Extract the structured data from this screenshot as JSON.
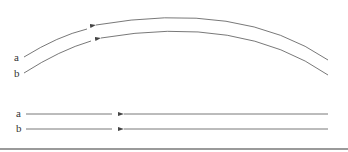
{
  "diagram": {
    "type": "path-comparison",
    "curved": {
      "labels": {
        "a": "a",
        "b": "b"
      },
      "arrow_direction": "left"
    },
    "straight": {
      "labels": {
        "a": "a",
        "b": "b"
      },
      "arrow_direction": "left"
    },
    "colors": {
      "line": "#555555",
      "text": "#333333",
      "rule": "#9a9a9a"
    }
  }
}
